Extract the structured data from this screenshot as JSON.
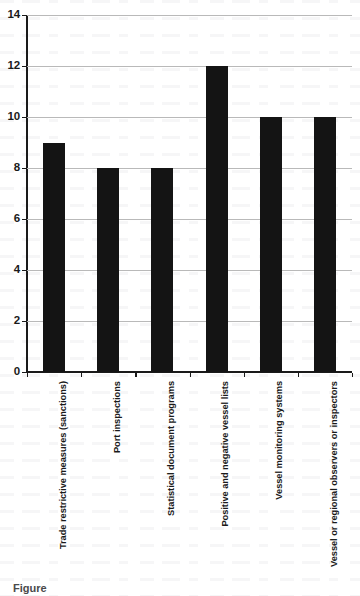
{
  "chart_data": {
    "type": "bar",
    "title": "",
    "xlabel": "",
    "ylabel": "",
    "ylim": [
      0,
      14
    ],
    "ytick_step": 2,
    "yticks": [
      0,
      2,
      4,
      6,
      8,
      10,
      12,
      14
    ],
    "grid": true,
    "legend": false,
    "orientation": "vertical",
    "bar_color": "#141414",
    "gridline_color": "#b9b9b9",
    "axis_color": "#1a1a1a",
    "categories": [
      "Trade restrictive measures (sanctions)",
      "Port inspections",
      "Statistical document programs",
      "Positive and negative vessel lists",
      "Vessel monitoring systems",
      "Vessel or regional observers or inspectors"
    ],
    "values": [
      9,
      8,
      8,
      12,
      10,
      10
    ]
  },
  "caption": {
    "clipped_text": "Figure"
  }
}
